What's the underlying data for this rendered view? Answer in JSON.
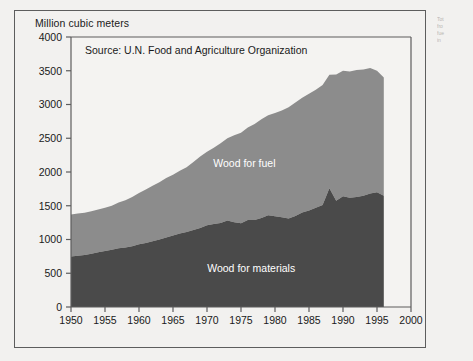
{
  "figure": {
    "y_axis_title": "Million cubic meters",
    "source_note": "Source: U.N. Food and Agriculture Organization"
  },
  "side_note": {
    "lines": [
      "Tot",
      "fro",
      "fue",
      "in"
    ]
  },
  "colors": {
    "page_background": "#f2f1ef",
    "plot_background": "#f4f3f1",
    "frame": "#5d5d5d",
    "wood_for_fuel": "#8c8c8c",
    "wood_for_materials": "#4a4a4a",
    "text": "#1a1a1a",
    "series_label": "#ffffff"
  },
  "chart_data": {
    "type": "area",
    "stacked": true,
    "title": "",
    "subtitle": "",
    "annotations": [
      "Source: U.N. Food and Agriculture Organization"
    ],
    "xlabel": "",
    "ylabel": "Million cubic meters",
    "xlim": [
      1950,
      2000
    ],
    "ylim": [
      0,
      4000
    ],
    "yticks": [
      0,
      500,
      1000,
      1500,
      2000,
      2500,
      3000,
      3500,
      4000
    ],
    "ytick_labels": [
      "0",
      "500",
      "1000",
      "1500",
      "2000",
      "2500",
      "3000",
      "3500",
      "4000"
    ],
    "xticks": [
      1950,
      1955,
      1960,
      1965,
      1970,
      1975,
      1980,
      1985,
      1990,
      1995,
      2000
    ],
    "xtick_labels": [
      "1950",
      "1955",
      "1960",
      "1965",
      "1970",
      "1975",
      "1980",
      "1985",
      "1990",
      "1995",
      "2000"
    ],
    "grid": false,
    "legend_position": "inline-labels",
    "x": [
      1950,
      1951,
      1952,
      1953,
      1954,
      1955,
      1956,
      1957,
      1958,
      1959,
      1960,
      1961,
      1962,
      1963,
      1964,
      1965,
      1966,
      1967,
      1968,
      1969,
      1970,
      1971,
      1972,
      1973,
      1974,
      1975,
      1976,
      1977,
      1978,
      1979,
      1980,
      1981,
      1982,
      1983,
      1984,
      1985,
      1986,
      1987,
      1988,
      1989,
      1990,
      1991,
      1992,
      1993,
      1994,
      1995,
      1996
    ],
    "series": [
      {
        "name": "Wood for materials",
        "color": "#4a4a4a",
        "values": [
          750,
          760,
          770,
          790,
          810,
          830,
          850,
          870,
          880,
          900,
          930,
          950,
          975,
          1000,
          1030,
          1060,
          1090,
          1110,
          1140,
          1170,
          1210,
          1230,
          1245,
          1280,
          1255,
          1240,
          1290,
          1290,
          1320,
          1360,
          1345,
          1330,
          1310,
          1350,
          1400,
          1430,
          1470,
          1510,
          1760,
          1575,
          1640,
          1620,
          1630,
          1650,
          1680,
          1700,
          1650
        ]
      },
      {
        "name": "Wood for fuel",
        "color": "#8c8c8c",
        "values": [
          620,
          625,
          625,
          630,
          635,
          640,
          650,
          680,
          700,
          730,
          760,
          790,
          820,
          850,
          880,
          900,
          930,
          960,
          1010,
          1060,
          1090,
          1130,
          1180,
          1220,
          1290,
          1340,
          1370,
          1420,
          1460,
          1480,
          1530,
          1580,
          1650,
          1680,
          1700,
          1730,
          1750,
          1780,
          1680,
          1870,
          1860,
          1870,
          1880,
          1870,
          1860,
          1800,
          1750
        ]
      }
    ],
    "totals": [
      1370,
      1385,
      1395,
      1420,
      1445,
      1470,
      1500,
      1550,
      1580,
      1630,
      1690,
      1740,
      1795,
      1850,
      1910,
      1960,
      2020,
      2070,
      2150,
      2230,
      2300,
      2360,
      2425,
      2500,
      2545,
      2580,
      2660,
      2710,
      2780,
      2840,
      2875,
      2910,
      2960,
      3030,
      3100,
      3160,
      3220,
      3290,
      3440,
      3445,
      3500,
      3490,
      3510,
      3520,
      3540,
      3500,
      3400
    ]
  }
}
